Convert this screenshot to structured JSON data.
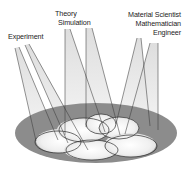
{
  "diagram": {
    "type": "spotlight-convergence",
    "labels": {
      "experiment": "Experiment",
      "theory": "Theory",
      "simulation": "Simulation",
      "material_scientist": "Material Scientist",
      "mathematician": "Mathematician",
      "engineer": "Engineer"
    },
    "colors": {
      "outer_ellipse": "#8c8c8c",
      "inner_light": "#f2f2f2",
      "beam_fill": "#e2e2e2",
      "line": "#333333",
      "text": "#222222"
    }
  }
}
